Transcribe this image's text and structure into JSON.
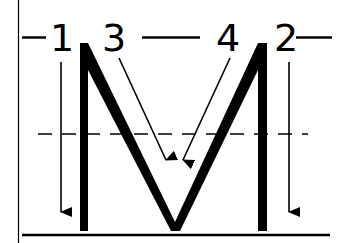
{
  "diagram": {
    "letter": "M",
    "stroke_numbers": [
      "1",
      "3",
      "4",
      "2"
    ],
    "strokes": [
      {
        "order": "1",
        "description": "left vertical stroke, top to bottom"
      },
      {
        "order": "2",
        "description": "right vertical stroke, top to bottom"
      },
      {
        "order": "3",
        "description": "left diagonal, down to the middle"
      },
      {
        "order": "4",
        "description": "right diagonal, down to the middle"
      }
    ],
    "guides": {
      "midline": "dashed",
      "baseline": "solid",
      "left_margin": "solid"
    },
    "colors": {
      "ink": "#000000",
      "background": "#ffffff"
    }
  }
}
